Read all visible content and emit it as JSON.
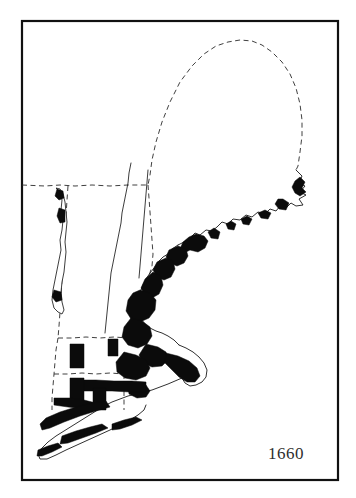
{
  "figure": {
    "kind": "historical-settlement-map",
    "region_title": "New England",
    "year_label": "1660",
    "background_color": "#ffffff",
    "frame_color": "#111111",
    "settled_fill_color": "#0b0b0b",
    "coastline_color": "#1a1a1a",
    "boundary_color": "#2a2a2a",
    "year_text_color": "#2e2e2e"
  },
  "legend_semantics": {
    "settled_area_meaning": "Area of English settlement",
    "dashed_line_meaning": "Colony / state boundary",
    "solid_thin_line_meaning": "Coastline and rivers"
  },
  "frame": {
    "x": 22,
    "y": 21,
    "width": 316,
    "height": 459
  },
  "map_features": {
    "coastlines": [
      {
        "name": "maine-northern-coast-and-penobscot",
        "d": "M296 170 L302 176 L299 183 L305 186 L300 192 L306 195 L299 199 L303 205 L296 206 L291 203 L286 208 L280 206 L276 211 L270 209 L265 214 L258 212 L252 217 L246 215 L240 220 L233 219 L228 224 L222 222 L217 227 L212 231 L206 230 L200 235 L195 233 L190 238 L184 242 L178 245"
      },
      {
        "name": "casco-bay-coast",
        "d": "M178 245 L172 249 L168 254 L163 257 L158 262 L154 268 L150 273 L146 279 L143 285 L140 292 L138 299 L136 306"
      },
      {
        "name": "massachusetts-bay-coast",
        "d": "M136 306 L138 313 L141 319 L145 324 L150 328 L156 331 L162 333 L168 336 L174 340 L179 345"
      },
      {
        "name": "cape-cod-outline",
        "d": "M179 345 L186 348 L193 352 L199 357 L204 363 L207 370 L206 377 L202 382 L196 385 L190 386 L185 383 L182 378 L184 372 L189 369 L194 370 L197 374"
      },
      {
        "name": "south-coast-and-sound",
        "d": "M182 378 L175 381 L168 384 L160 387 L152 390 L144 392 L136 394 L128 396 L120 399 L112 402 L104 406"
      },
      {
        "name": "long-island-outline",
        "d": "M104 406 L96 411 L88 416 L80 421 L72 426 L64 431 L56 436 L48 442 L42 448 L38 454 L40 459 L47 459 L56 455 L66 450 L77 445 L88 440 L99 435 L110 430 L120 425 L130 420 L138 415 L144 410 L146 405"
      }
    ],
    "rivers": [
      {
        "name": "connecticut-river",
        "d": "M131 163 L129 173 L128 183 L126 193 L124 203 L122 213 L121 223 L119 233 L117 243 L115 253 L113 263 L111 273 L110 283 L109 293 L108 303 L107 313 L106 323 L105 333"
      },
      {
        "name": "merrimack-and-nh-interior",
        "d": "M148 170 L147 182 L146 194 L145 206 L144 218 L143 230 L142 242 L141 254 L140 266 L139 278"
      }
    ],
    "boundaries": [
      {
        "name": "maine-northern-dashed-border",
        "d": "M22 185 L45 186 L60 185 L75 186 L92 185 L110 186 L128 185 L148 185 L150 175 L152 160 L156 142 L162 122 L170 102 L180 82 L192 66 L204 54 L216 46 L228 42 L240 40 L252 41 L262 45 L272 52 L282 62 L290 74 L296 88 L300 104 L302 120 L302 136 L300 152 L298 166 L296 170"
      },
      {
        "name": "maine-nh-dashed-border",
        "d": "M148 185 L149 198 L150 212 L151 226 L152 240 L153 254 L152 266 L149 276 L145 285 L140 292 L136 300 L134 306"
      },
      {
        "name": "vermont-western-dashed-border",
        "d": "M68 186 L67 200 L66 216 L65 232 L64 248 L63 264 L62 280 L61 296 L60 312 L59 326 L58 338"
      },
      {
        "name": "ma-northern-dashed-border",
        "d": "M58 338 L72 338 L86 337 L100 338 L114 337 L128 338 L140 337"
      },
      {
        "name": "ct-ri-northern-dashed-border",
        "d": "M54 374 L68 374 L82 373 L96 374 L110 373 L124 374 L136 373"
      },
      {
        "name": "ct-western-dashed-border",
        "d": "M58 338 L56 350 L55 362 L54 374 L53 386 L52 398 L52 410"
      },
      {
        "name": "ri-ct-dashed-border",
        "d": "M124 374 L124 386 L124 398 L124 410"
      }
    ],
    "lakes": [
      {
        "name": "lake-champlain",
        "d": "M56 188 L60 192 L62 200 L61 210 L63 220 L62 230 L60 240 L61 250 L59 260 L57 270 L55 280 L53 290 L52 300 L54 308 L58 312 L62 314 L64 310 L62 302 L61 292 L62 282 L64 272 L65 262 L66 252 L65 242 L66 232 L67 222 L66 212 L65 202 L63 194 L60 189 Z"
      }
    ],
    "settled_areas": [
      {
        "name": "downeast-maine-coastal-settlements",
        "d": "M300 177 L305 182 L302 188 L306 192 L300 196 L295 193 L292 187 L295 181 Z"
      },
      {
        "name": "mount-desert-coastal-strip",
        "d": "M283 199 L289 203 L286 210 L279 209 L275 204 L278 199 Z"
      },
      {
        "name": "penobscot-outer-islands",
        "d": "M265 210 L271 213 L268 219 L261 218 L258 213 Z"
      },
      {
        "name": "muscongus-settlement-dots",
        "d": "M247 216 L252 219 L249 225 L243 224 L241 219 Z"
      },
      {
        "name": "sheepscot-settlement",
        "d": "M231 221 L236 224 L234 230 L228 229 L226 224 Z"
      },
      {
        "name": "sagadahoc-settlement",
        "d": "M214 228 L220 232 L218 239 L211 238 L208 232 Z"
      },
      {
        "name": "casco-bay-settlement-belt",
        "d": "M196 234 L204 236 L208 241 L205 248 L198 252 L190 250 L184 253 L180 249 L183 242 L189 237 Z"
      },
      {
        "name": "saco-wells-settlement-belt",
        "d": "M178 246 L186 249 L188 256 L184 263 L177 266 L170 263 L166 257 L169 250 Z"
      },
      {
        "name": "piscataqua-portsmouth-settlement",
        "d": "M166 258 L173 261 L175 269 L171 277 L164 280 L157 277 L153 270 L157 262 Z"
      },
      {
        "name": "north-shore-essex-settlement",
        "d": "M153 272 L161 276 L163 285 L159 294 L152 298 L145 295 L141 288 L145 279 Z"
      },
      {
        "name": "boston-harbor-core-settlement",
        "d": "M140 290 L150 293 L156 300 L155 310 L149 318 L140 322 L131 319 L126 311 L128 300 L133 293 Z"
      },
      {
        "name": "boston-south-shore-settlement",
        "d": "M131 318 L142 321 L150 327 L152 336 L147 344 L138 348 L128 345 L122 337 L124 327 Z"
      },
      {
        "name": "plymouth-settlement",
        "d": "M146 344 L158 347 L166 352 L168 360 L162 366 L152 367 L143 363 L139 355 Z"
      },
      {
        "name": "cape-cod-settlement-strip",
        "d": "M166 353 L178 356 L189 361 L197 368 L200 376 L195 382 L187 382 L179 377 L172 370 L165 363 Z"
      },
      {
        "name": "narragansett-providence-settlement",
        "d": "M124 352 L136 355 L146 360 L150 368 L146 376 L136 380 L125 378 L117 372 L116 362 Z"
      },
      {
        "name": "rhode-island-aquidneck-settlement",
        "d": "M136 382 L146 385 L150 391 L146 397 L137 398 L129 394 L128 387 Z"
      },
      {
        "name": "connecticut-shore-settlement-band",
        "d": "M78 380 L96 380 L114 381 L132 381 L146 382 L146 392 L130 392 L112 391 L94 391 L78 391 Z"
      },
      {
        "name": "new-haven-settlement-block",
        "d": "M93 388 L106 388 L106 410 L93 410 Z"
      },
      {
        "name": "hartford-settlement-block",
        "d": "M70 378 L84 378 L84 404 L70 404 Z"
      },
      {
        "name": "windsor-springfield-block",
        "d": "M70 344 L84 344 L84 368 L70 368 Z"
      },
      {
        "name": "upper-connecticut-valley-block",
        "d": "M108 339 L118 339 L118 356 L108 356 Z"
      },
      {
        "name": "stamford-fairfield-settlement",
        "d": "M54 398 L70 398 L84 400 L96 403 L98 409 L84 409 L68 407 L54 405 Z"
      },
      {
        "name": "long-island-north-shore-settlement",
        "d": "M46 418 L60 412 L76 407 L92 403 L106 401 L110 407 L96 411 L80 416 L64 422 L50 428 L42 430 L40 424 Z"
      },
      {
        "name": "long-island-mid-settlement",
        "d": "M62 436 L76 431 L90 427 L102 424 L108 428 L96 433 L82 438 L68 443 L60 444 Z"
      },
      {
        "name": "long-island-east-end-settlement",
        "d": "M112 424 L124 420 L136 417 L142 420 L132 425 L120 429 L112 430 Z"
      },
      {
        "name": "long-island-west-end-settlement",
        "d": "M38 450 L48 446 L58 443 L62 447 L52 452 L42 456 L37 456 Z"
      },
      {
        "name": "lake-champlain-north-settlement",
        "d": "M57 189 L63 191 L64 198 L59 200 L55 196 Z"
      },
      {
        "name": "lake-champlain-mid-settlement",
        "d": "M59 208 L65 210 L65 222 L60 223 L57 216 Z"
      },
      {
        "name": "lake-champlain-south-settlement",
        "d": "M54 290 L61 292 L62 300 L56 302 L52 297 Z"
      }
    ]
  },
  "year_marker": {
    "text": "1660",
    "x": 268,
    "y": 459
  }
}
